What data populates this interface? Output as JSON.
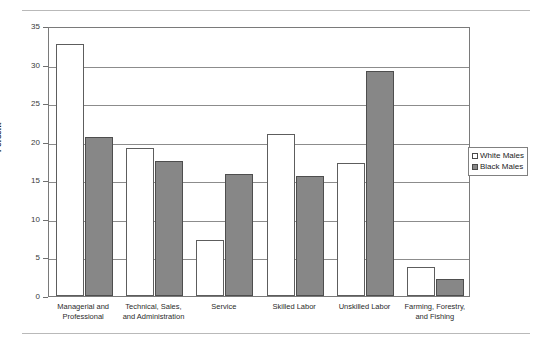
{
  "chart_data": {
    "type": "bar",
    "title": "",
    "xlabel": "",
    "ylabel": "Percent",
    "ylim": [
      0,
      35
    ],
    "ytick_step": 5,
    "yticks": [
      "0",
      "5",
      "10",
      "15",
      "20",
      "25",
      "30",
      "35"
    ],
    "grid": true,
    "legend_position": "right",
    "categories": [
      "Managerial and Professional",
      "Technical, Sales, and Administration",
      "Service",
      "Skilled Labor",
      "Unskilled Labor",
      "Farming, Forestry, and Fishing"
    ],
    "category_lines": [
      [
        "Managerial and",
        "Professional"
      ],
      [
        "Technical, Sales,",
        "and Administration"
      ],
      [
        "Service"
      ],
      [
        "Skilled Labor"
      ],
      [
        "Unskilled Labor"
      ],
      [
        "Farming, Forestry,",
        "and Fishing"
      ]
    ],
    "series": [
      {
        "name": "White Males",
        "color": "#ffffff",
        "values": [
          32.7,
          19.2,
          7.3,
          21.0,
          17.2,
          3.8
        ]
      },
      {
        "name": "Black Males",
        "color": "#878787",
        "values": [
          20.6,
          17.5,
          15.8,
          15.6,
          29.2,
          2.2
        ]
      }
    ]
  },
  "legend": {
    "items": [
      {
        "label": "White Males",
        "swatch": "white"
      },
      {
        "label": "Black Males",
        "swatch": "gray"
      }
    ]
  }
}
